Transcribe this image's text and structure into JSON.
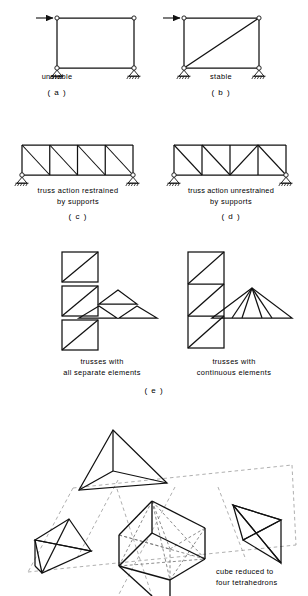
{
  "figure": {
    "stroke_color": "#111111",
    "dashed_color": "#999999",
    "background": "#ffffff"
  },
  "panels": {
    "a": {
      "letter": "( a )",
      "caption": "unstable",
      "load_arrow": "horizontal-load-arrow",
      "frame": {
        "nodes": [
          [
            57,
            18
          ],
          [
            134,
            18
          ],
          [
            134,
            68
          ],
          [
            57,
            68
          ]
        ],
        "members": [
          [
            0,
            1
          ],
          [
            1,
            2
          ],
          [
            2,
            3
          ],
          [
            3,
            0
          ]
        ],
        "diagonals": []
      },
      "supports": [
        [
          57,
          68
        ],
        [
          134,
          68
        ]
      ]
    },
    "b": {
      "letter": "( b )",
      "caption": "stable",
      "load_arrow": "horizontal-load-arrow",
      "frame": {
        "nodes": [
          [
            184,
            18
          ],
          [
            259,
            18
          ],
          [
            259,
            68
          ],
          [
            184,
            68
          ]
        ],
        "members": [
          [
            0,
            1
          ],
          [
            1,
            2
          ],
          [
            2,
            3
          ],
          [
            3,
            0
          ]
        ],
        "diagonals": [
          [
            3,
            1
          ]
        ]
      },
      "supports": [
        [
          184,
          68
        ],
        [
          259,
          68
        ]
      ]
    },
    "c": {
      "letter": "( c )",
      "caption_line1": "truss action restrained",
      "caption_line2": "by supports",
      "truss": {
        "left": 22,
        "right": 133,
        "top": 145,
        "bottom": 175,
        "bays": 4,
        "diagonal_pattern": [
          "\\",
          "\\",
          "\\",
          "\\"
        ]
      },
      "supports": [
        [
          22,
          175
        ],
        [
          133,
          175
        ]
      ]
    },
    "d": {
      "letter": "( d )",
      "caption_line1": "truss action unrestrained",
      "caption_line2": "by supports",
      "truss": {
        "left": 174,
        "right": 286,
        "top": 145,
        "bottom": 175,
        "bays": 4,
        "diagonal_pattern": [
          "\\",
          "\\",
          "/",
          "\\"
        ]
      },
      "supports": [
        [
          174,
          175
        ],
        [
          286,
          175
        ]
      ]
    },
    "e": {
      "letter": "( e )",
      "left_caption_line1": "trusses with",
      "left_caption_line2": "all separate elements",
      "right_caption_line1": "trusses with",
      "right_caption_line2": "continuous elements",
      "left_stack": {
        "x": 62,
        "width": 36,
        "y_top": 252,
        "cell_h": 30,
        "gap": 4,
        "cells": 3,
        "style": "separate"
      },
      "right_stack": {
        "x": 188,
        "width": 36,
        "y_top": 252,
        "cell_h": 32,
        "gap": 0,
        "cells": 3,
        "style": "continuous"
      },
      "left_roof": {
        "apex": [
          118,
          290
        ],
        "left": [
          79,
          318
        ],
        "right": [
          157,
          318
        ],
        "style": "separate"
      },
      "right_roof": {
        "apex": [
          252,
          288
        ],
        "left": [
          212,
          318
        ],
        "right": [
          292,
          318
        ],
        "style": "continuous"
      }
    }
  },
  "tetra_figure": {
    "caption_line1": "cube reduced to",
    "caption_line2": "four tetrahedrons",
    "parts": [
      {
        "name": "top-tetrahedron"
      },
      {
        "name": "left-tetrahedron"
      },
      {
        "name": "center-cube"
      },
      {
        "name": "right-tetrahedron"
      }
    ]
  }
}
